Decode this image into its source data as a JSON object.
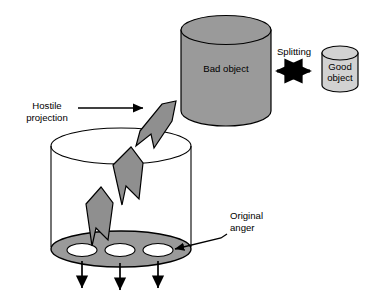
{
  "diagram": {
    "colors": {
      "bad_object_fill": "#9a9a9a",
      "good_object_fill": "#d2d2d2",
      "container_base_fill": "#9a9a9a",
      "arrow_fill": "#8f8f8f",
      "hole_fill": "#ffffff",
      "stroke": "#000000",
      "background": "#ffffff"
    },
    "labels": {
      "bad_object": "Bad object",
      "good_object_line1": "Good",
      "good_object_line2": "object",
      "splitting": "Splitting",
      "hostile_line1": "Hostile",
      "hostile_line2": "projection",
      "original_line1": "Original",
      "original_line2": "anger"
    },
    "elements": {
      "bad_object_cylinder": "bad-object-cylinder",
      "good_object_cylinder": "good-object-cylinder",
      "splitting_arrow": "splitting-double-arrow",
      "container_cylinder": "container-cylinder",
      "container_base": "container-base-ellipse",
      "holes_count": 3,
      "outflow_arrows_count": 3,
      "projection_bolt_segments": 3,
      "hostile_pointer": "hostile-projection-arrow",
      "original_pointer": "original-anger-arrow"
    }
  }
}
